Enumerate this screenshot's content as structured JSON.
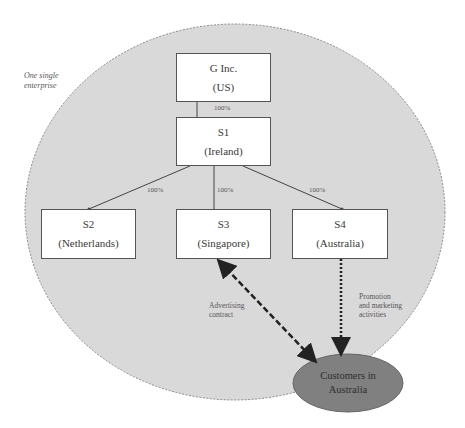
{
  "diagram": {
    "enterprise_label": [
      "One single",
      "enterprise"
    ],
    "colors": {
      "enterprise_fill": "#d9d9d9",
      "enterprise_border": "#8a8a8a",
      "box_fill": "#ffffff",
      "box_border": "#555555",
      "customers_fill": "#808080",
      "line": "#444444"
    },
    "nodes": {
      "parent": {
        "name": "G Inc.",
        "country": "(US)"
      },
      "s1": {
        "name": "S1",
        "country": "(Ireland)"
      },
      "s2": {
        "name": "S2",
        "country": "(Netherlands)"
      },
      "s3": {
        "name": "S3",
        "country": "(Singapore)"
      },
      "s4": {
        "name": "S4",
        "country": "(Australia)"
      },
      "customers": {
        "line1": "Customers in",
        "line2": "Australia"
      }
    },
    "ownership": {
      "parent_to_s1": "100%",
      "s1_to_s2": "100%",
      "s1_to_s3": "100%",
      "s1_to_s4": "100%"
    },
    "relations": {
      "s3_customers": {
        "style": "dashed bidirectional",
        "label": [
          "Advertising",
          "contract"
        ]
      },
      "s4_customers": {
        "style": "dotted",
        "label": [
          "Promotion",
          "and marketing",
          "activities"
        ]
      }
    }
  }
}
